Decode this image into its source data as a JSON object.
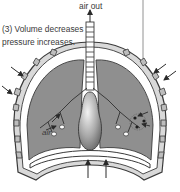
{
  "diagram": {
    "title_label": "air out",
    "caption_line1": "(3) Volume decreases",
    "caption_line2": "pressure increases.",
    "inner_label": "air",
    "colors": {
      "lung_fill": "#8f8f8f",
      "outline": "#3a3a3a",
      "ribcage_fill": "#d9d9d9",
      "background": "#ffffff"
    }
  }
}
